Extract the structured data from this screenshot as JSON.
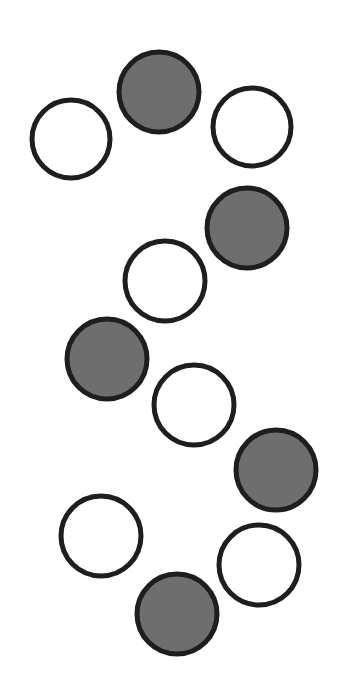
{
  "canvas": {
    "width": 344,
    "height": 697,
    "background": "#ffffff"
  },
  "style": {
    "stroke": "#1e1e1e",
    "stroke_width": 5,
    "filled_color": "#6e6e6e",
    "empty_color": "#ffffff"
  },
  "circles": [
    {
      "cx": 71,
      "cy": 139,
      "r": 39,
      "filled": false
    },
    {
      "cx": 159,
      "cy": 92,
      "r": 40,
      "filled": true
    },
    {
      "cx": 252,
      "cy": 127,
      "r": 39,
      "filled": false
    },
    {
      "cx": 247,
      "cy": 228,
      "r": 40,
      "filled": true
    },
    {
      "cx": 165,
      "cy": 281,
      "r": 40,
      "filled": false
    },
    {
      "cx": 107,
      "cy": 359,
      "r": 40,
      "filled": true
    },
    {
      "cx": 194,
      "cy": 405,
      "r": 40,
      "filled": false
    },
    {
      "cx": 276,
      "cy": 470,
      "r": 40,
      "filled": true
    },
    {
      "cx": 101,
      "cy": 536,
      "r": 40,
      "filled": false
    },
    {
      "cx": 259,
      "cy": 565,
      "r": 40,
      "filled": false
    },
    {
      "cx": 177,
      "cy": 614,
      "r": 40,
      "filled": true
    }
  ]
}
